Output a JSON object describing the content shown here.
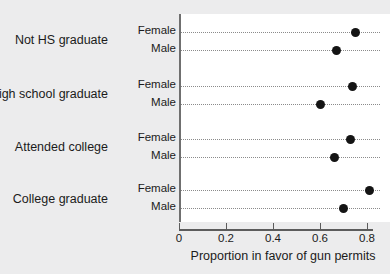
{
  "chart_data": {
    "type": "scatter",
    "subtype": "cleveland-dot-plot",
    "title": "",
    "xlabel": "Proportion in favor of gun permits",
    "ylabel": "",
    "xlim": [
      0,
      0.89
    ],
    "xticks": [
      0,
      0.2,
      0.4,
      0.6,
      0.8
    ],
    "xticklabels": [
      "0",
      "0.2",
      "0.4",
      "0.6",
      "0.8"
    ],
    "grid": "dotted horizontal guide line per row",
    "legend": "none",
    "categories": [
      "Not HS graduate",
      "High school graduate",
      "Attended college",
      "College graduate"
    ],
    "groups": [
      "Female",
      "Male"
    ],
    "series": [
      {
        "name": "Female",
        "values": [
          0.75,
          0.74,
          0.73,
          0.81
        ]
      },
      {
        "name": "Male",
        "values": [
          0.67,
          0.6,
          0.66,
          0.7
        ]
      }
    ],
    "points": [
      {
        "category": "Not HS graduate",
        "group": "Female",
        "value": 0.75
      },
      {
        "category": "Not HS graduate",
        "group": "Male",
        "value": 0.67
      },
      {
        "category": "High school graduate",
        "group": "Female",
        "value": 0.74
      },
      {
        "category": "High school graduate",
        "group": "Male",
        "value": 0.6
      },
      {
        "category": "Attended college",
        "group": "Female",
        "value": 0.73
      },
      {
        "category": "Attended college",
        "group": "Male",
        "value": 0.66
      },
      {
        "category": "College graduate",
        "group": "Female",
        "value": 0.81
      },
      {
        "category": "College graduate",
        "group": "Male",
        "value": 0.7
      }
    ],
    "colors": {
      "marker": "#141414",
      "guideline": "#8b8b8b",
      "axis": "#5c5c5c",
      "panel_background": "#ffffff",
      "figure_background": "#ececed"
    }
  }
}
